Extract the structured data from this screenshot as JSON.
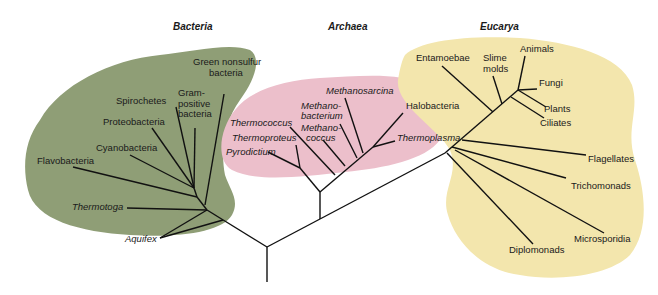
{
  "domains": {
    "bacteria": {
      "label": "Bacteria",
      "color": "#8f9e76"
    },
    "archaea": {
      "label": "Archaea",
      "color": "#ecbfcb"
    },
    "eucarya": {
      "label": "Eucarya",
      "color": "#f3e6ad"
    }
  },
  "bacteria_taxa": {
    "green_nonsulfur_1": "Green nonsulfur",
    "green_nonsulfur_2": "bacteria",
    "gram_positive_1": "Gram-",
    "gram_positive_2": "positive",
    "gram_positive_3": "bacteria",
    "spirochetes": "Spirochetes",
    "proteobacteria": "Proteobacteria",
    "cyanobacteria": "Cyanobacteria",
    "flavobacteria": "Flavobacteria",
    "thermotoga": "Thermotoga",
    "aquifex": "Aquifex"
  },
  "archaea_taxa": {
    "methanosarcina": "Methanosarcina",
    "methanobacterium_1": "Methano-",
    "methanobacterium_2": "bacterium",
    "methanococcus_1": "Methano-",
    "methanococcus_2": "coccus",
    "thermococcus": "Thermococcus",
    "thermoproteus": "Thermoproteus",
    "pyrodictium": "Pyrodictium",
    "halobacteria": "Halobacteria",
    "thermoplasma": "Thermoplasma"
  },
  "eucarya_taxa": {
    "entamoebae": "Entamoebae",
    "slime_molds_1": "Slime",
    "slime_molds_2": "molds",
    "animals": "Animals",
    "fungi": "Fungi",
    "plants": "Plants",
    "ciliates": "Ciliates",
    "flagellates": "Flagellates",
    "trichomonads": "Trichomonads",
    "microsporidia": "Microsporidia",
    "diplomonads": "Diplomonads"
  }
}
